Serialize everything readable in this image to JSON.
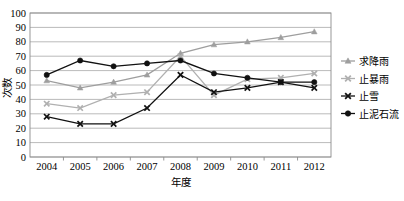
{
  "chart_data": {
    "type": "line",
    "title": "",
    "xlabel": "年度",
    "ylabel": "次数",
    "categories": [
      "2004",
      "2005",
      "2006",
      "2007",
      "2008",
      "2009",
      "2010",
      "2011",
      "2012"
    ],
    "x": [
      2004,
      2005,
      2006,
      2007,
      2008,
      2009,
      2010,
      2011,
      2012
    ],
    "ylim": [
      0,
      100
    ],
    "yticks": [
      0,
      10,
      20,
      30,
      40,
      50,
      60,
      70,
      80,
      90,
      100
    ],
    "grid": true,
    "legend_position": "right",
    "series": [
      {
        "name": "求降雨",
        "color": "#9e9e9e",
        "marker": "triangle",
        "values": [
          53,
          48,
          52,
          57,
          72,
          78,
          80,
          83,
          87
        ]
      },
      {
        "name": "止暴雨",
        "color": "#b0b0b0",
        "marker": "x",
        "values": [
          37,
          34,
          43,
          45,
          70,
          43,
          54,
          55,
          58
        ]
      },
      {
        "name": "止雪",
        "color": "#111111",
        "marker": "x",
        "values": [
          28,
          23,
          23,
          34,
          57,
          45,
          48,
          52,
          48
        ]
      },
      {
        "name": "止泥石流",
        "color": "#111111",
        "marker": "circle",
        "values": [
          57,
          67,
          63,
          65,
          67,
          58,
          55,
          52,
          52
        ]
      }
    ]
  },
  "axis": {
    "y_label": "次数",
    "x_label": "年度",
    "y_ticks": [
      "100",
      "90",
      "80",
      "70",
      "60",
      "50",
      "40",
      "30",
      "20",
      "10",
      "0"
    ],
    "x_ticks": [
      "2004",
      "2005",
      "2006",
      "2007",
      "2008",
      "2009",
      "2010",
      "2011",
      "2012"
    ]
  },
  "legend": {
    "items": [
      {
        "label": "求降雨",
        "color": "#9e9e9e",
        "marker": "triangle"
      },
      {
        "label": "止暴雨",
        "color": "#b0b0b0",
        "marker": "x"
      },
      {
        "label": "止雪",
        "color": "#111111",
        "marker": "x"
      },
      {
        "label": "止泥石流",
        "color": "#111111",
        "marker": "circle"
      }
    ]
  },
  "colors": {
    "grid": "#a8a8a8",
    "frame": "#8c8c8c",
    "background": "#ffffff",
    "text": "#000000"
  }
}
